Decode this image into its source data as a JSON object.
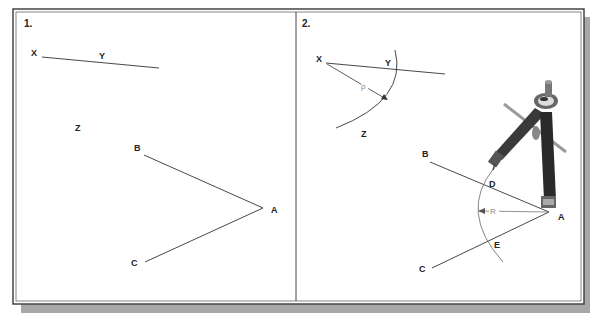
{
  "figure": {
    "frame": {
      "border_color": "#444444",
      "shadow_color": "#a8a8a8",
      "background": "#ffffff"
    },
    "panels": [
      {
        "number": "1.",
        "labels": {
          "X": "X",
          "Y": "Y",
          "Z": "Z",
          "A": "A",
          "B": "B",
          "C": "C"
        }
      },
      {
        "number": "2.",
        "labels": {
          "X": "X",
          "Y": "Y",
          "Z": "Z",
          "A": "A",
          "B": "B",
          "C": "C",
          "D": "D",
          "E": "E"
        },
        "radius_labels": {
          "arc_xyz": "ρ",
          "arc_de": "R"
        },
        "tool": "compass-icon"
      }
    ]
  }
}
